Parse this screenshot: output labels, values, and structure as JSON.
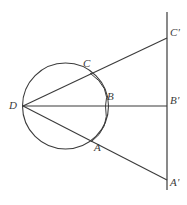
{
  "figure": {
    "background_color": "#ffffff",
    "stroke_color": "#3b3b3b",
    "label_color": "#3b3b3b",
    "width": 187,
    "height": 205
  },
  "labels": {
    "d": "D",
    "a": "A",
    "b": "B",
    "c": "C",
    "a_prime": "A'",
    "b_prime": "B'",
    "c_prime": "C'"
  },
  "geometry": {
    "circle": {
      "cx": 65.5,
      "cy": 106,
      "r": 43
    },
    "vertical_line": {
      "x": 167,
      "y1": 12,
      "y2": 190
    },
    "points": {
      "D": {
        "x": 23,
        "y": 106
      },
      "A": {
        "x": 91,
        "y": 142
      },
      "B": {
        "x": 105.5,
        "y": 106
      },
      "C": {
        "x": 90,
        "y": 73
      },
      "A_prime": {
        "x": 167,
        "y": 180
      },
      "B_prime": {
        "x": 167,
        "y": 106
      },
      "C_prime": {
        "x": 167,
        "y": 38
      }
    },
    "rays": [
      {
        "name": "ray-D-C-Cprime",
        "from": "D",
        "through": "C",
        "to": "C_prime"
      },
      {
        "name": "ray-D-B-Bprime",
        "from": "D",
        "through": "B",
        "to": "B_prime"
      },
      {
        "name": "ray-D-A-Aprime",
        "from": "D",
        "through": "A",
        "to": "A_prime"
      }
    ],
    "chord_arcs": [
      {
        "name": "arc-C-B",
        "from": "C",
        "to": "B"
      },
      {
        "name": "arc-B-A",
        "from": "B",
        "to": "A"
      }
    ]
  }
}
